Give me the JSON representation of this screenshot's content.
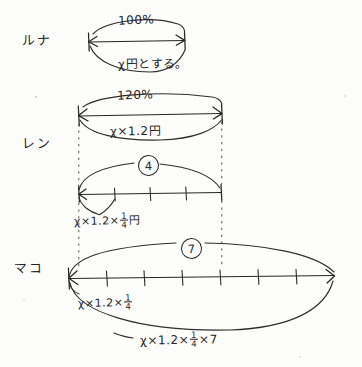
{
  "diagram": {
    "ink_color": "#262626",
    "paper_color": "#fdfdfc"
  },
  "rows": [
    {
      "name": "ルナ",
      "percent_label": "100%",
      "below_label": "χ円とする。",
      "segments": 1
    },
    {
      "name": "レン",
      "percent_label": "120%",
      "below_label": "χ×1.2円",
      "circled_number": "4",
      "segment_label_prefix": "χ×1.2×",
      "segment_label_num": "1",
      "segment_label_den": "4",
      "segment_label_suffix": "円",
      "segments": 4
    },
    {
      "name": "マコ",
      "circled_number": "7",
      "segment_label_prefix": "χ×1.2×",
      "segment_label_num": "1",
      "segment_label_den": "4",
      "total_label_prefix": "χ×1.2×",
      "total_label_num": "1",
      "total_label_den": "4",
      "total_label_suffix": "×7",
      "segments": 7
    }
  ]
}
